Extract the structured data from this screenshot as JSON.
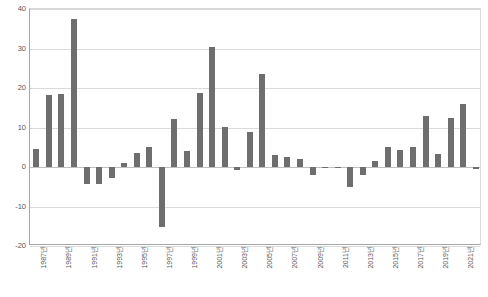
{
  "chart_data": {
    "type": "bar",
    "title": "",
    "subtitle": "",
    "xlabel": "",
    "ylabel": "",
    "ylim": [
      -20,
      40
    ],
    "yticks": [
      40,
      30,
      20,
      10,
      0,
      -10,
      -20
    ],
    "grid": true,
    "legend": "none",
    "bar_color": "#6e6e6e",
    "gridline_color": "#d9d9d9",
    "axis_color": "#a6a6a6",
    "x": [
      "1987년",
      "1988년",
      "1989년",
      "1990년",
      "1991년",
      "1992년",
      "1993년",
      "1994년",
      "1995년",
      "1996년",
      "1997년",
      "1998년",
      "1999년",
      "2000년",
      "2001년",
      "2002년",
      "2003년",
      "2004년",
      "2005년",
      "2006년",
      "2007년",
      "2008년",
      "2009년",
      "2010년",
      "2011년",
      "2012년",
      "2013년",
      "2014년",
      "2015년",
      "2016년",
      "2017년",
      "2018년",
      "2019년",
      "2020년",
      "2021년",
      "2022년"
    ],
    "tick_labels": [
      "1987년",
      "1989년",
      "1991년",
      "1993년",
      "1995년",
      "1997년",
      "1999년",
      "2001년",
      "2003년",
      "2005년",
      "2007년",
      "2009년",
      "2011년",
      "2013년",
      "2015년",
      "2017년",
      "2019년",
      "2021년"
    ],
    "tick_label_indices": [
      0,
      2,
      4,
      6,
      8,
      10,
      12,
      14,
      16,
      18,
      20,
      22,
      24,
      26,
      28,
      30,
      32,
      34
    ],
    "values": [
      4.5,
      18.2,
      18.6,
      37.4,
      -4.4,
      -4.3,
      -2.8,
      1.0,
      3.6,
      5.0,
      -15.1,
      12.2,
      4.0,
      18.8,
      30.5,
      10.1,
      -0.8,
      8.8,
      23.5,
      3.0,
      2.6,
      2.0,
      -2.0,
      -0.3,
      -0.3,
      -5.0,
      -2.0,
      1.5,
      5.0,
      4.2,
      5.0,
      13.0,
      3.4,
      12.5,
      16.0,
      -0.4
    ]
  }
}
